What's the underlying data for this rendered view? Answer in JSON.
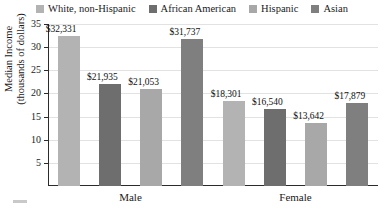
{
  "chart_data": {
    "type": "bar",
    "title": "",
    "subtitle": "",
    "xlabel": "",
    "ylabel": "Median Income (thousands of dollars)",
    "ylabel_lines": [
      "Median Income",
      "(thousands of dollars)"
    ],
    "categories": [
      "Male",
      "Female"
    ],
    "ylim": [
      0,
      35
    ],
    "yticks": [
      5,
      10,
      15,
      20,
      25,
      30,
      35
    ],
    "ytick_labels": [
      "5",
      "10",
      "15",
      "20",
      "25",
      "30",
      "35"
    ],
    "grid": true,
    "grid_axis": "y",
    "legend_position": "top",
    "value_prefix": "$",
    "units": "dollars",
    "series": [
      {
        "name": "White, non-Hispanic",
        "color": "#b3b3b3",
        "values": [
          32331,
          18301
        ],
        "labels": [
          "$32,331",
          "$18,301"
        ],
        "plotted_thousands": [
          32.331,
          18.301
        ]
      },
      {
        "name": "African American",
        "color": "#6e6e6e",
        "values": [
          21935,
          16540
        ],
        "labels": [
          "$21,935",
          "$16,540"
        ],
        "plotted_thousands": [
          21.935,
          16.54
        ]
      },
      {
        "name": "Hispanic",
        "color": "#a8a8a8",
        "values": [
          21053,
          13642
        ],
        "labels": [
          "$21,053",
          "$13,642"
        ],
        "plotted_thousands": [
          21.053,
          13.642
        ]
      },
      {
        "name": "Asian",
        "color": "#7f7f7f",
        "values": [
          31737,
          17879
        ],
        "labels": [
          "$31,737",
          "$17,879"
        ],
        "plotted_thousands": [
          31.737,
          17.879
        ]
      }
    ],
    "bars": [
      {
        "group": "Male",
        "series": "White, non-Hispanic",
        "label": "$32,331",
        "value": 32331
      },
      {
        "group": "Male",
        "series": "African American",
        "label": "$21,935",
        "value": 21935
      },
      {
        "group": "Male",
        "series": "Hispanic",
        "label": "$21,053",
        "value": 21053
      },
      {
        "group": "Male",
        "series": "Asian",
        "label": "$31,737",
        "value": 31737
      },
      {
        "group": "Female",
        "series": "White, non-Hispanic",
        "label": "$18,301",
        "value": 18301
      },
      {
        "group": "Female",
        "series": "African American",
        "label": "$16,540",
        "value": 16540
      },
      {
        "group": "Female",
        "series": "Hispanic",
        "label": "$13,642",
        "value": 13642
      },
      {
        "group": "Female",
        "series": "Asian",
        "label": "$17,879",
        "value": 17879
      }
    ]
  },
  "legend": {
    "items": [
      {
        "label": "White, non-Hispanic",
        "color": "#b3b3b3"
      },
      {
        "label": "African American",
        "color": "#6e6e6e"
      },
      {
        "label": "Hispanic",
        "color": "#a8a8a8"
      },
      {
        "label": "Asian",
        "color": "#7f7f7f"
      }
    ]
  },
  "axes": {
    "y": {
      "label_line1": "Median Income",
      "label_line2": "(thousands of dollars)",
      "ticks": [
        "35",
        "30",
        "25",
        "20",
        "15",
        "10",
        "5"
      ]
    },
    "x": {
      "groups": [
        "Male",
        "Female"
      ]
    }
  }
}
